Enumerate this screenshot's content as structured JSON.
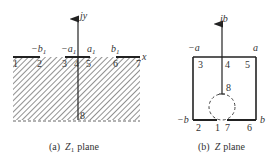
{
  "figure": {
    "panels": [
      {
        "id": "a",
        "caption_prefix": "(a)",
        "caption_var": "Z",
        "caption_sub": "1",
        "caption_suffix": "plane",
        "axis_vertical_label": "jy",
        "axis_horizontal_label": "x",
        "axis_labels": [
          {
            "text": "−b",
            "sub": "1"
          },
          {
            "text": "−a",
            "sub": "1"
          },
          {
            "text": "a",
            "sub": "1"
          },
          {
            "text": "b",
            "sub": "1"
          }
        ],
        "points": [
          "1",
          "2",
          "3",
          "4",
          "5",
          "6",
          "7",
          "8"
        ]
      },
      {
        "id": "b",
        "caption_prefix": "(b)",
        "caption_var": "Z",
        "caption_suffix": "plane",
        "axis_vertical_label": "jb",
        "corner_labels": {
          "top_left": "−a",
          "top_right": "a",
          "bottom_left": "−b",
          "bottom_right": "b"
        },
        "points": [
          "3",
          "4",
          "5",
          "8",
          "2",
          "1",
          "7",
          "6"
        ]
      }
    ],
    "colors": {
      "line": "#222222",
      "hatch": "#555555",
      "text": "#333333",
      "background": "#ffffff"
    }
  }
}
